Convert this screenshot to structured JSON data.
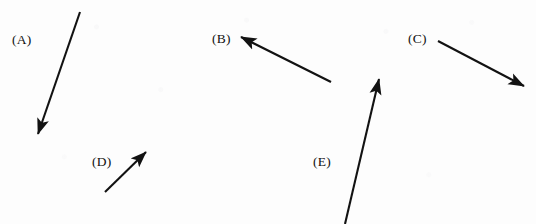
{
  "figure": {
    "background_color": "#fdfdfd",
    "stroke_color": "#121212",
    "width": 536,
    "height": 224
  },
  "chart_data": {
    "type": "diagram",
    "title": "",
    "xlabel": "",
    "ylabel": "",
    "grid": false,
    "legend": "none",
    "xlim": [
      0,
      536
    ],
    "ylim": [
      0,
      224
    ],
    "note": "Five straight black arrows (vectors) each annotated with a parenthesized letter label. Coordinates are in image pixel space with origin at top-left.",
    "vectors": [
      {
        "label": "(A)",
        "tail": [
          80,
          12
        ],
        "tip": [
          38,
          134
        ],
        "dx": -42,
        "dy": 122,
        "length": 129,
        "direction": "down-left",
        "angle_deg": 251,
        "label_pos": [
          12,
          33
        ]
      },
      {
        "label": "(B)",
        "tail": [
          331,
          82
        ],
        "tip": [
          241,
          37
        ],
        "dx": -90,
        "dy": -45,
        "length": 101,
        "direction": "up-left",
        "angle_deg": 153,
        "label_pos": [
          212,
          32
        ]
      },
      {
        "label": "(C)",
        "tail": [
          438,
          41
        ],
        "tip": [
          524,
          86
        ],
        "dx": 86,
        "dy": 45,
        "length": 97,
        "direction": "down-right",
        "angle_deg": 333,
        "label_pos": [
          408,
          32
        ]
      },
      {
        "label": "(D)",
        "tail": [
          105,
          192
        ],
        "tip": [
          146,
          152
        ],
        "dx": 41,
        "dy": -40,
        "length": 57,
        "direction": "up-right",
        "angle_deg": 44,
        "label_pos": [
          92,
          155
        ]
      },
      {
        "label": "(E)",
        "tail": [
          345,
          224
        ],
        "tip": [
          379,
          79
        ],
        "dx": 34,
        "dy": -145,
        "length": 149,
        "direction": "up-right-steep",
        "angle_deg": 77,
        "label_pos": [
          313,
          155
        ]
      }
    ]
  },
  "labels": {
    "a": "(A)",
    "b": "(B)",
    "c": "(C)",
    "d": "(D)",
    "e": "(E)"
  }
}
